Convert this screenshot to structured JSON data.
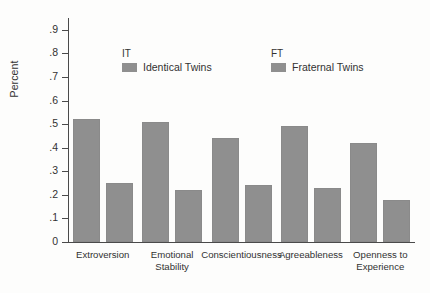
{
  "chart_data": {
    "type": "bar",
    "title": "",
    "xlabel": "",
    "ylabel": "Percent",
    "ylim": [
      0,
      0.95
    ],
    "grid": false,
    "legend_position": "top-center",
    "categories": [
      "Extroversion",
      "Emotional\nStability",
      "Conscientiousness",
      "Agreeableness",
      "Openness to\nExperience"
    ],
    "ytick_labels": [
      "0",
      ".1",
      ".2",
      ".3",
      ".4",
      ".5",
      ".6",
      ".7",
      ".8",
      ".9"
    ],
    "ytick_values": [
      0,
      0.1,
      0.2,
      0.3,
      0.4,
      0.5,
      0.6,
      0.7,
      0.8,
      0.9
    ],
    "series": [
      {
        "name": "Identical Twins",
        "key": "IT",
        "color": "#8f8f8f",
        "values": [
          0.52,
          0.51,
          0.44,
          0.49,
          0.42
        ]
      },
      {
        "name": "Fraternal Twins",
        "key": "FT",
        "color": "#8f8f8f",
        "values": [
          0.25,
          0.22,
          0.24,
          0.23,
          0.18
        ]
      }
    ]
  },
  "axis": {
    "y_title": "Percent"
  },
  "legend": {
    "items": [
      {
        "key": "IT",
        "label": "Identical Twins"
      },
      {
        "key": "FT",
        "label": "Fraternal Twins"
      }
    ]
  },
  "colors": {
    "bar": "#8f8f8f",
    "axis": "#4a4a4a",
    "text": "#323232",
    "background": "#fdfdfc"
  }
}
